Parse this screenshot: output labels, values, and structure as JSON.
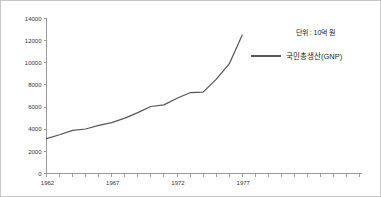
{
  "chart_data": {
    "type": "line",
    "title": "",
    "subtitle": "",
    "xlabel": "",
    "ylabel": "",
    "unit_note": "단위 : 10억 원",
    "grid": false,
    "legend_position": "top-right",
    "xlim": [
      1962,
      1986
    ],
    "ylim": [
      0,
      14000
    ],
    "y_ticks": [
      0,
      2000,
      4000,
      6000,
      8000,
      10000,
      12000,
      14000
    ],
    "y_tick_labels": [
      "0",
      "2000",
      "4000",
      "6000",
      "8000",
      "10000",
      "12000",
      "14000"
    ],
    "x_tick_labels_shown": [
      "1962",
      "1967",
      "1972",
      "1977"
    ],
    "x_tick_label_years": [
      1962,
      1967,
      1972,
      1977
    ],
    "x_tick_step_years": 1,
    "series": [
      {
        "name": "국민총생산(GNP)",
        "color": "#555555",
        "x": [
          1962,
          1963,
          1964,
          1965,
          1966,
          1967,
          1968,
          1969,
          1970,
          1971,
          1972,
          1973,
          1974,
          1975,
          1976,
          1977
        ],
        "values": [
          3150,
          3500,
          3900,
          4020,
          4350,
          4600,
          5000,
          5500,
          6050,
          6200,
          6800,
          7300,
          7350,
          8500,
          9900,
          12500
        ]
      }
    ]
  },
  "legend": {
    "entries": [
      {
        "label": "국민총생산(GNP)",
        "color": "#555555"
      }
    ]
  },
  "axes": {
    "y_axis_color": "#9a9a9a",
    "x_axis_color": "#9a9a9a"
  }
}
